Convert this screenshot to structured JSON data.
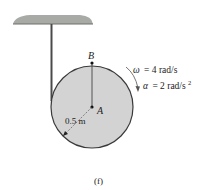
{
  "figure": {
    "caption": "(f)",
    "colors": {
      "disk_fill": "#d3d3d3",
      "disk_stroke": "#3a3a3a",
      "ceiling": "#a8aaa6",
      "rope": "#4a4a4a",
      "text": "#222222"
    },
    "labels": {
      "point_b": "B",
      "point_a": "A",
      "radius": "0.5 m",
      "omega_symbol": "ω",
      "omega_value": "= 4 rad/s",
      "alpha_symbol": "α",
      "alpha_value": "= 2 rad/s",
      "alpha_exp": "2"
    },
    "parameters": {
      "radius_m": 0.5,
      "omega_rad_s": 4,
      "alpha_rad_s2": 2,
      "rotation_direction": "clockwise"
    }
  }
}
